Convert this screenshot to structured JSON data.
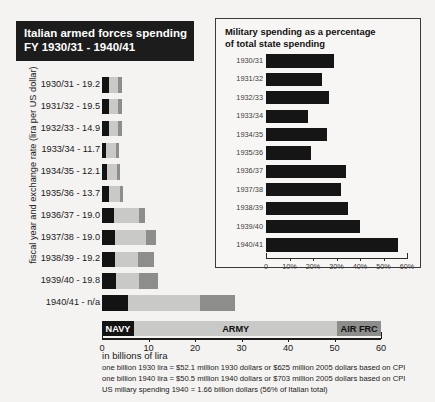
{
  "main": {
    "title_line1": "Italian armed forces spending",
    "title_line2": "FY 1930/31 - 1940/41",
    "y_axis_label": "fiscal year and exchange rate (lira per US dollar)",
    "x_unit_label": "in billions of lira",
    "legend": [
      {
        "key": "navy",
        "label": "NAVY",
        "color": "#131313"
      },
      {
        "key": "army",
        "label": "ARMY",
        "color": "#c9c9c7"
      },
      {
        "key": "air",
        "label": "AIR FRC",
        "color": "#8d8d8b"
      }
    ],
    "footnotes": [
      "one billion 1930 lira = $52.1 million 1930 dollars or $625 million 2005 dollars based on CPI",
      "one billion 1940 lira = $50.5 million 1940 dollars or $703 million 2005 dollars based on CPI",
      "US miliary spending 1940 = 1.66 billion dollars (56% of Italian total)"
    ]
  },
  "inset": {
    "title_line1": "Military spending as a percentage",
    "title_line2": "of total state spending"
  },
  "chart_data": [
    {
      "type": "bar",
      "orientation": "horizontal",
      "stacked": true,
      "title": "Italian armed forces spending FY 1930/31 - 1940/41",
      "xlabel": "in billions of lira",
      "ylabel": "fiscal year and exchange rate (lira per US dollar)",
      "xlim": [
        0,
        60
      ],
      "xticks": [
        0,
        10,
        20,
        30,
        40,
        50,
        60
      ],
      "xtick_labels": [
        "0",
        "10",
        "20",
        "30",
        "40",
        "50",
        "60"
      ],
      "grid": false,
      "legend": [
        "NAVY",
        "ARMY",
        "AIR FRC"
      ],
      "legend_position": "bottom-band",
      "categories": [
        "1930/31 - 19.2",
        "1931/32 - 19.5",
        "1932/33 - 14.9",
        "1933/34 - 11.7",
        "1934/35 - 12.1",
        "1935/36 - 13.7",
        "1936/37 - 19.0",
        "1937/38 - 19.0",
        "1938/39 - 19.2",
        "1939/40 - 19.8",
        "1940/41 - n/a"
      ],
      "fiscal_years": [
        "1930/31",
        "1931/32",
        "1932/33",
        "1933/34",
        "1934/35",
        "1935/36",
        "1936/37",
        "1937/38",
        "1938/39",
        "1939/40",
        "1940/41"
      ],
      "exchange_rate_lira_per_usd": [
        19.2,
        19.5,
        14.9,
        11.7,
        12.1,
        13.7,
        19.0,
        19.0,
        19.2,
        19.8,
        null
      ],
      "series": [
        {
          "name": "NAVY",
          "color": "#131313",
          "values": [
            1.5,
            1.4,
            1.5,
            0.9,
            1.1,
            1.6,
            2.6,
            2.7,
            2.8,
            3.0,
            5.5
          ]
        },
        {
          "name": "ARMY",
          "color": "#c9c9c7",
          "values": [
            2.0,
            2.1,
            2.0,
            2.2,
            2.1,
            2.2,
            5.4,
            6.8,
            4.9,
            5.0,
            15.5
          ]
        },
        {
          "name": "AIR FRC",
          "color": "#8d8d8b",
          "values": [
            0.7,
            0.7,
            0.8,
            0.5,
            0.7,
            0.8,
            1.3,
            2.2,
            3.5,
            4.0,
            7.5
          ]
        }
      ],
      "totals": [
        4.2,
        4.2,
        4.3,
        3.6,
        3.9,
        4.6,
        9.3,
        11.7,
        11.2,
        12.0,
        28.5
      ]
    },
    {
      "type": "bar",
      "orientation": "horizontal",
      "title": "Military spending as a percentage of total state spending",
      "xlabel": "",
      "ylabel": "",
      "xlim": [
        0,
        60
      ],
      "xticks": [
        0,
        10,
        20,
        30,
        40,
        50,
        60
      ],
      "xtick_labels": [
        "0",
        "10%",
        "20%",
        "30%",
        "40%",
        "50%",
        "60%"
      ],
      "grid": false,
      "categories": [
        "1930/31",
        "1931/32",
        "1932/33",
        "1933/34",
        "1934/35",
        "1935/36",
        "1936/37",
        "1937/38",
        "1938/39",
        "1939/40",
        "1940/41"
      ],
      "values": [
        29,
        24,
        27,
        18,
        26,
        19,
        34,
        32,
        35,
        40,
        56
      ],
      "bar_color": "#151515"
    }
  ]
}
